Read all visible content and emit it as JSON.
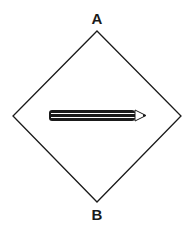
{
  "diagram": {
    "shape": "diamond",
    "labels": {
      "top": "A",
      "bottom": "B"
    },
    "center_icon": "pencil-icon",
    "colors": {
      "stroke": "#1a1a1a",
      "background": "#ffffff",
      "pencil_body": "#1a1a1a"
    }
  }
}
